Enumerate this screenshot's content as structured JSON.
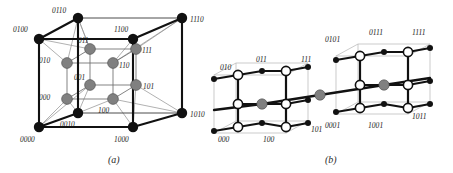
{
  "figure": {
    "background": "#ffffff",
    "panels": [
      {
        "id": "a",
        "caption": "(a)",
        "caption_pos": [
          108,
          160
        ],
        "description": "4-dimensional hypercube drawn as an outer cube of 8 black filled vertices labelled with 4-bit strings and an inner cube of 8 gray filled vertices labelled with 3-bit strings",
        "outer_nodes": [
          {
            "label": "0100",
            "x": 39,
            "y": 39,
            "lx": 13,
            "ly": 32,
            "anchor": "start"
          },
          {
            "label": "0110",
            "x": 78,
            "y": 18,
            "lx": 52,
            "ly": 13,
            "anchor": "start"
          },
          {
            "label": "1100",
            "x": 133,
            "y": 39,
            "lx": 114,
            "ly": 32,
            "anchor": "start"
          },
          {
            "label": "1110",
            "x": 182,
            "y": 18,
            "lx": 190,
            "ly": 22,
            "anchor": "start"
          },
          {
            "label": "0000",
            "x": 39,
            "y": 127,
            "lx": 20,
            "ly": 142,
            "anchor": "start"
          },
          {
            "label": "0010",
            "x": 78,
            "y": 113,
            "lx": 60,
            "ly": 127,
            "anchor": "start"
          },
          {
            "label": "1000",
            "x": 133,
            "y": 127,
            "lx": 114,
            "ly": 142,
            "anchor": "start"
          },
          {
            "label": "1010",
            "x": 182,
            "y": 113,
            "lx": 190,
            "ly": 117,
            "anchor": "start"
          }
        ],
        "inner_nodes": [
          {
            "label": "010",
            "x": 67,
            "y": 63,
            "lx": 39,
            "ly": 63,
            "anchor": "start"
          },
          {
            "label": "011",
            "x": 90,
            "y": 49,
            "lx": 78,
            "ly": 43,
            "anchor": "start"
          },
          {
            "label": "110",
            "x": 113,
            "y": 63,
            "lx": 119,
            "ly": 68,
            "anchor": "start"
          },
          {
            "label": "111",
            "x": 136,
            "y": 49,
            "lx": 142,
            "ly": 53,
            "anchor": "start"
          },
          {
            "label": "000",
            "x": 67,
            "y": 99,
            "lx": 39,
            "ly": 100,
            "anchor": "start"
          },
          {
            "label": "001",
            "x": 90,
            "y": 85,
            "lx": 74,
            "ly": 80,
            "anchor": "start"
          },
          {
            "label": "100",
            "x": 113,
            "y": 99,
            "lx": 98,
            "ly": 113,
            "anchor": "start"
          },
          {
            "label": "101",
            "x": 136,
            "y": 85,
            "lx": 143,
            "ly": 89,
            "anchor": "start"
          }
        ]
      },
      {
        "id": "b",
        "caption": "(b)",
        "caption_pos": [
          325,
          160
        ],
        "description": "Two 3-cubes of hollow white circles and small black dots joined by a long diagonal edge through two gray nodes; left cube labelled with 3-bit strings, right cube with 4-bit strings",
        "left_labels": [
          {
            "label": "010",
            "x": 220,
            "y": 70
          },
          {
            "label": "011",
            "x": 256,
            "y": 62
          },
          {
            "label": "111",
            "x": 301,
            "y": 62
          },
          {
            "label": "000",
            "x": 218,
            "y": 142
          },
          {
            "label": "100",
            "x": 263,
            "y": 142
          },
          {
            "label": "101",
            "x": 311,
            "y": 132
          }
        ],
        "right_labels": [
          {
            "label": "0101",
            "x": 325,
            "y": 42
          },
          {
            "label": "0111",
            "x": 369,
            "y": 35
          },
          {
            "label": "1111",
            "x": 412,
            "y": 35
          },
          {
            "label": "0001",
            "x": 325,
            "y": 128
          },
          {
            "label": "1001",
            "x": 368,
            "y": 128
          },
          {
            "label": "1011",
            "x": 412,
            "y": 119
          }
        ]
      }
    ]
  },
  "colors": {
    "node_black": "#111111",
    "node_gray": "#808080",
    "node_white": "#ffffff",
    "edge_dark": "#111111",
    "edge_light": "#9a9a9a",
    "text": "#1a1a1a",
    "background": "#ffffff"
  }
}
